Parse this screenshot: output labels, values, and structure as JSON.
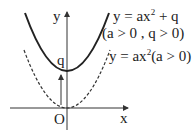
{
  "diagram": {
    "axes": {
      "x_label": "x",
      "y_label": "y",
      "origin_label": "O"
    },
    "vertex_label": "q",
    "curves": [
      {
        "name": "shifted-parabola",
        "style": "solid",
        "equation_prefix": "y = ax",
        "equation_exp": "2",
        "equation_suffix": " + q",
        "condition": "(a > 0 , q > 0)"
      },
      {
        "name": "base-parabola",
        "style": "dashed",
        "equation_prefix": "y = ax",
        "equation_exp": "2",
        "equation_suffix": "(a > 0)"
      }
    ],
    "shift_arrow": "upward translation by q",
    "colors": {
      "stroke": "#222222",
      "background": "#ffffff"
    }
  }
}
